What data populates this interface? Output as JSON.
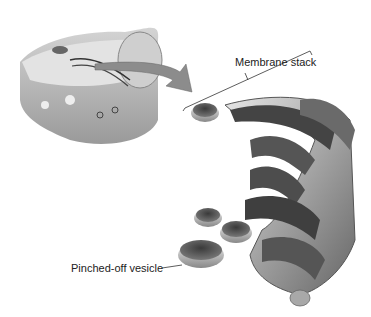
{
  "diagram": {
    "labels": {
      "membrane_stack": "Membrane stack",
      "vesicle": "Pinched-off vesicle"
    },
    "colors": {
      "membrane_dark": "#4a4a4a",
      "membrane_mid": "#8a8a8a",
      "membrane_light": "#d6d6d6",
      "cell": "#b5b5b5",
      "arrow": "#8c8c8c"
    }
  }
}
